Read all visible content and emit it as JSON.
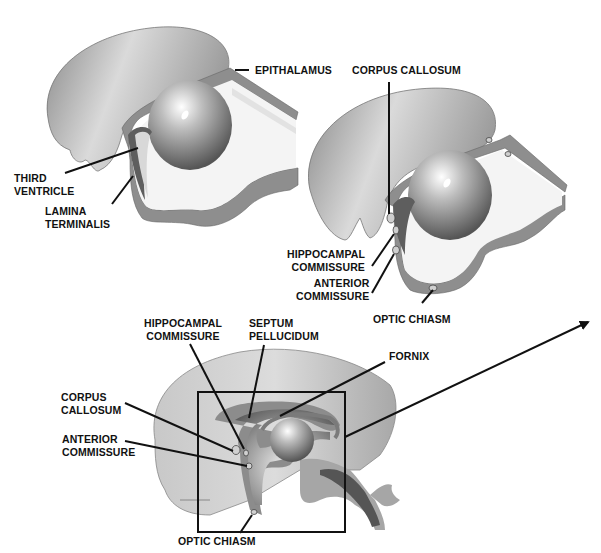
{
  "diagram": {
    "panels": [
      {
        "id": "panel-early",
        "labels": {
          "epithalamus": "EPITHALAMUS",
          "third_ventricle": [
            "THIRD",
            "VENTRICLE"
          ],
          "lamina_terminalis": [
            "LAMINA",
            "TERMINALIS"
          ]
        }
      },
      {
        "id": "panel-mid",
        "labels": {
          "corpus_callosum": "CORPUS CALLOSUM",
          "hippocampal_commissure": [
            "HIPPOCAMPAL",
            "COMMISSURE"
          ],
          "anterior_commissure": [
            "ANTERIOR",
            "COMMISSURE"
          ],
          "optic_chiasm": "OPTIC CHIASM"
        }
      },
      {
        "id": "panel-late",
        "labels": {
          "hippocampal_commissure": [
            "HIPPOCAMPAL",
            "COMMISSURE"
          ],
          "septum_pellucidum": [
            "SEPTUM",
            "PELLUCIDUM"
          ],
          "fornix": "FORNIX",
          "corpus_callosum": [
            "CORPUS",
            "CALLOSUM"
          ],
          "anterior_commissure": [
            "ANTERIOR",
            "COMMISSURE"
          ],
          "optic_chiasm": "OPTIC CHIASM"
        }
      }
    ],
    "colors": {
      "hemisphere_light": "#d8d8d8",
      "hemisphere_dark": "#7a7a7a",
      "wall": "#8c8c8c",
      "wall_dark": "#555555",
      "cavity": "#f2f2f2",
      "leader_line": "#111111",
      "label_text": "#111111"
    }
  }
}
